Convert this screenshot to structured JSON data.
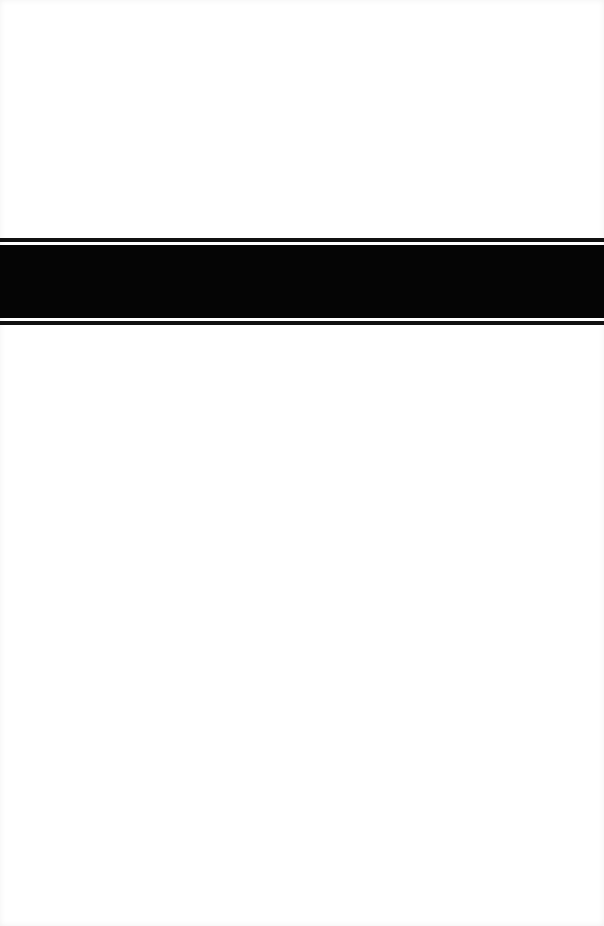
{
  "page": {
    "background_color": "#ffffff",
    "band": {
      "color": "#050505",
      "top_rule_color": "#111111",
      "bottom_rule_color": "#111111"
    }
  }
}
